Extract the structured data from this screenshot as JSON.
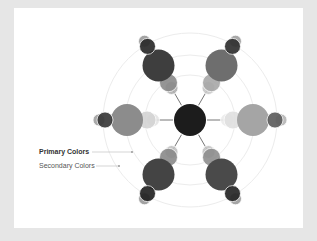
{
  "diagram": {
    "type": "radial-color-wheel",
    "center": {
      "x": 190,
      "y": 120,
      "r": 16,
      "fill": "#1c1c1c"
    },
    "rings": [
      {
        "r": 45,
        "stroke": "#ececec"
      },
      {
        "r": 65,
        "stroke": "#ececec"
      },
      {
        "r": 87,
        "stroke": "#ececec"
      }
    ],
    "arms": [
      {
        "name": "upper-left",
        "angle": -120,
        "big_fill": "#3e3e3e",
        "inner_fill": "#8a8a8a",
        "inner2_fill": "#b0b0b0",
        "outer_fill": "#2a2a2a",
        "outer2_fill": "#9a9a9a"
      },
      {
        "name": "upper-right",
        "angle": -60,
        "big_fill": "#6e6e6e",
        "inner_fill": "#a8a8a8",
        "inner2_fill": "#c8c8c8",
        "outer_fill": "#303030",
        "outer2_fill": "#a0a0a0"
      },
      {
        "name": "right",
        "angle": 0,
        "big_fill": "#a5a5a5",
        "inner_fill": "#e0e0e0",
        "inner2_fill": "#ececec",
        "outer_fill": "#5e5e5e",
        "outer2_fill": "#b5b5b5"
      },
      {
        "name": "lower-right",
        "angle": 60,
        "big_fill": "#4a4a4a",
        "inner_fill": "#8e8e8e",
        "inner2_fill": "#c4c4c4",
        "outer_fill": "#262626",
        "outer2_fill": "#9c9c9c"
      },
      {
        "name": "lower-left",
        "angle": 120,
        "big_fill": "#444444",
        "inner_fill": "#8a8a8a",
        "inner2_fill": "#c0c0c0",
        "outer_fill": "#232323",
        "outer2_fill": "#999999"
      },
      {
        "name": "left",
        "angle": 180,
        "big_fill": "#8c8c8c",
        "inner_fill": "#d4d4d4",
        "inner2_fill": "#e4e4e4",
        "outer_fill": "#3a3a3a",
        "outer2_fill": "#a0a0a0"
      }
    ]
  },
  "legend": {
    "primary_label": "Primary Colors",
    "secondary_label": "Secondary Colors",
    "primary_line": {
      "x1": 92,
      "y1": 152,
      "x2": 132,
      "y2": 152,
      "dot_x": 132
    },
    "secondary_line": {
      "x1": 96,
      "y1": 166,
      "x2": 119,
      "y2": 166,
      "dot_x": 119
    }
  }
}
